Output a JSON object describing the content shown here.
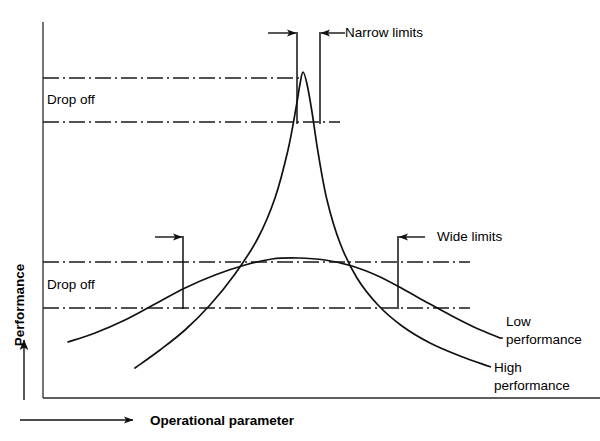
{
  "figure": {
    "width": 600,
    "height": 441,
    "background": "#ffffff",
    "ink_color": "#111111"
  },
  "axes": {
    "y_title": "Performance",
    "x_title": "Operational parameter",
    "y_axis_x": 43,
    "y_axis_top": 22,
    "y_axis_bottom": 398,
    "x_axis_y": 420,
    "x_axis_left": 20,
    "x_axis_right": 133,
    "frame_left": 43,
    "frame_bottom": 398,
    "frame_right": 600
  },
  "labels": {
    "narrow_limits": "Narrow limits",
    "wide_limits": "Wide limits",
    "drop_off_upper": "Drop off",
    "drop_off_lower": "Drop off",
    "low_performance_line1": "Low",
    "low_performance_line2": "performance",
    "high_performance_line1": "High",
    "high_performance_line2": "performance"
  },
  "chart_data": {
    "type": "line",
    "xlabel": "Operational parameter",
    "ylabel": "Performance",
    "grid": false,
    "legend": "inline-leader-labels",
    "axis_ranges": {
      "x_pixels": [
        43,
        600
      ],
      "y_pixels": [
        398,
        22
      ]
    },
    "series": [
      {
        "name": "High performance",
        "description": "Tall narrow sharply peaked response curve; high peak performance but very narrow usable band",
        "label_position": "right-lower",
        "peak_pixel": [
          303,
          72
        ],
        "points": [
          [
            135,
            368
          ],
          [
            160,
            350
          ],
          [
            185,
            330
          ],
          [
            210,
            305
          ],
          [
            235,
            274
          ],
          [
            258,
            238
          ],
          [
            275,
            198
          ],
          [
            288,
            150
          ],
          [
            296,
            108
          ],
          [
            300,
            84
          ],
          [
            303,
            72
          ],
          [
            307,
            84
          ],
          [
            312,
            112
          ],
          [
            318,
            152
          ],
          [
            327,
            200
          ],
          [
            340,
            243
          ],
          [
            357,
            278
          ],
          [
            378,
            305
          ],
          [
            402,
            326
          ],
          [
            430,
            343
          ],
          [
            460,
            356
          ],
          [
            488,
            366
          ]
        ]
      },
      {
        "name": "Low performance",
        "description": "Broad flat-topped response curve; lower peak performance but wide usable band",
        "label_position": "right-upper",
        "peak_pixel": [
          298,
          258
        ],
        "points": [
          [
            68,
            342
          ],
          [
            95,
            333
          ],
          [
            125,
            320
          ],
          [
            155,
            304
          ],
          [
            185,
            288
          ],
          [
            215,
            275
          ],
          [
            245,
            265
          ],
          [
            272,
            259
          ],
          [
            298,
            258
          ],
          [
            325,
            260
          ],
          [
            352,
            266
          ],
          [
            378,
            276
          ],
          [
            403,
            289
          ],
          [
            428,
            303
          ],
          [
            452,
            316
          ],
          [
            476,
            328
          ],
          [
            500,
            338
          ]
        ]
      }
    ],
    "reference_lines": [
      {
        "name": "high-performance-peak-level",
        "orientation": "horizontal",
        "style": "dash-dot",
        "y_pixel": 78,
        "x_from": 43,
        "x_to": 300
      },
      {
        "name": "high-performance-acceptance-level",
        "orientation": "horizontal",
        "style": "dash-dot",
        "y_pixel": 122,
        "x_from": 43,
        "x_to": 340
      },
      {
        "name": "low-performance-peak-level",
        "orientation": "horizontal",
        "style": "dash-dot",
        "y_pixel": 262,
        "x_from": 43,
        "x_to": 470
      },
      {
        "name": "low-performance-acceptance-level",
        "orientation": "horizontal",
        "style": "dash-dot",
        "y_pixel": 308,
        "x_from": 43,
        "x_to": 470
      }
    ],
    "limit_markers": [
      {
        "name": "narrow-limit-left",
        "x_pixel": 297,
        "y_from": 32,
        "y_to": 124,
        "arrow": "points-right-to-line",
        "arrow_y": 33,
        "arrow_tail_x": 268
      },
      {
        "name": "narrow-limit-right",
        "x_pixel": 320,
        "y_from": 32,
        "y_to": 124,
        "arrow": "points-left-to-line",
        "arrow_y": 33,
        "arrow_tail_x": 345
      },
      {
        "name": "wide-limit-left",
        "x_pixel": 183,
        "y_from": 236,
        "y_to": 309,
        "arrow": "points-right-to-line",
        "arrow_y": 237,
        "arrow_tail_x": 155
      },
      {
        "name": "wide-limit-right",
        "x_pixel": 398,
        "y_from": 236,
        "y_to": 309,
        "arrow": "points-left-to-line",
        "arrow_y": 237,
        "arrow_tail_x": 425
      }
    ],
    "annotations": [
      {
        "text": "Narrow limits",
        "x_pixel": 345,
        "y_pixel": 33,
        "points_to": "narrow-limit-right"
      },
      {
        "text": "Wide limits",
        "x_pixel": 437,
        "y_pixel": 237,
        "points_to": "wide-limit-right"
      },
      {
        "text": "Drop off",
        "x_pixel": 50,
        "y_pixel": 100,
        "between": [
          "high-performance-peak-level",
          "high-performance-acceptance-level"
        ]
      },
      {
        "text": "Drop off",
        "x_pixel": 50,
        "y_pixel": 285,
        "between": [
          "low-performance-peak-level",
          "low-performance-acceptance-level"
        ]
      }
    ]
  }
}
